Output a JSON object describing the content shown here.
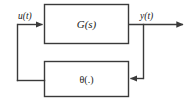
{
  "diagram": {
    "type": "control-system-block-diagram",
    "background_color": "#ffffff",
    "line_color": "#3a3a3a",
    "text_color": "#1a1a1a",
    "blocks": [
      {
        "id": "forward-block",
        "label": "G(s)",
        "role": "forward-path-transfer-function",
        "x": 44,
        "y": 4,
        "width": 84,
        "height": 40
      },
      {
        "id": "feedback-block",
        "label": "θ(.)",
        "role": "feedback-path-nonlinearity",
        "x": 44,
        "y": 61,
        "width": 84,
        "height": 36
      }
    ],
    "signals": [
      {
        "id": "input-signal",
        "label": "u(t)"
      },
      {
        "id": "output-signal",
        "label": "y(t)"
      }
    ]
  }
}
